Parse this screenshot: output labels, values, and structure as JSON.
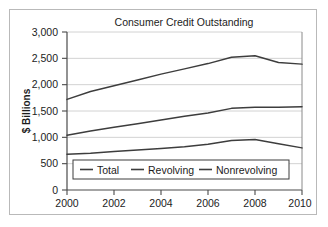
{
  "chart_data": {
    "type": "line",
    "title": "Consumer Credit Outstanding",
    "xlabel": "",
    "ylabel": "$ Billions",
    "xlim": [
      2000,
      2010
    ],
    "ylim": [
      0,
      3000
    ],
    "xticks": [
      "2000",
      "2002",
      "2004",
      "2006",
      "2008",
      "2010"
    ],
    "yticks": [
      "0",
      "500",
      "1,000",
      "1,500",
      "2,000",
      "2,500",
      "3,000"
    ],
    "grid": true,
    "legend_position": "bottom-center",
    "x": [
      2000,
      2001,
      2002,
      2003,
      2004,
      2005,
      2006,
      2007,
      2008,
      2009,
      2010
    ],
    "series": [
      {
        "name": "Total",
        "color": "#3d3d3d",
        "values": [
          1720,
          1870,
          1980,
          2090,
          2200,
          2300,
          2400,
          2520,
          2550,
          2420,
          2390
        ]
      },
      {
        "name": "Revolving",
        "color": "#3d3d3d",
        "values": [
          680,
          700,
          730,
          760,
          790,
          820,
          870,
          940,
          960,
          880,
          800
        ]
      },
      {
        "name": "Nonrevolving",
        "color": "#3d3d3d",
        "values": [
          1040,
          1120,
          1190,
          1260,
          1330,
          1400,
          1460,
          1550,
          1570,
          1570,
          1580
        ]
      }
    ]
  },
  "legend": {
    "items": [
      {
        "label": "Total"
      },
      {
        "label": "Revolving"
      },
      {
        "label": "Nonrevolving"
      }
    ]
  },
  "colors": {
    "line": "#3d3d3d",
    "grid": "#d2d2d2",
    "axis": "#4a4a4a",
    "frame": "#b9b9b9",
    "text": "#1c1c1c",
    "background": "#ffffff"
  }
}
